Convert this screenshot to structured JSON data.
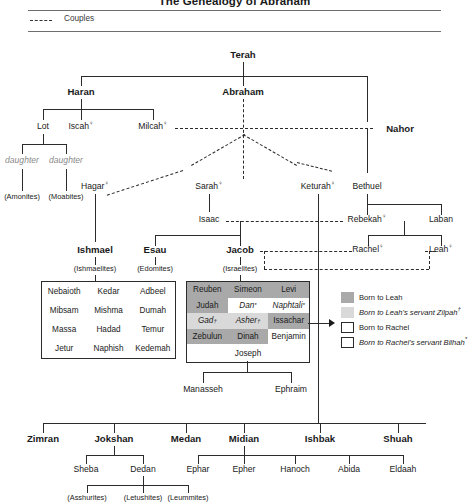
{
  "title": "The Genealogy of Abraham",
  "legend_couples": {
    "label": "Couples",
    "icon": "dashed-line-icon"
  },
  "people": {
    "terah": "Terah",
    "haran": "Haran",
    "abraham": "Abraham",
    "nahor": "Nahor",
    "lot": "Lot",
    "iscah": "Iscah",
    "milcah": "Milcah",
    "daughter1": "daughter",
    "daughter2": "daughter",
    "amonites": "(Amonites)",
    "moabites": "(Moabites)",
    "hagar": "Hagar",
    "sarah": "Sarah",
    "keturah": "Keturah",
    "bethuel": "Bethuel",
    "isaac": "Isaac",
    "rebekah": "Rebekah",
    "laban": "Laban",
    "ishmael": "Ishmael",
    "ishmaelites": "(Ishmaelites)",
    "esau": "Esau",
    "edomites": "(Edomites)",
    "jacob": "Jacob",
    "israelites": "(Israelites)",
    "rachel": "Rachel",
    "leah": "Leah",
    "joseph": "Joseph",
    "manasseh": "Manasseh",
    "ephraim": "Ephraim"
  },
  "female_mark": "♀",
  "ishmael_sons": [
    "Nebaioth",
    "Kedar",
    "Adbeel",
    "Mibsam",
    "Mishma",
    "Dumah",
    "Massa",
    "Hadad",
    "Temur",
    "Jetur",
    "Naphish",
    "Kedemah"
  ],
  "tribes": {
    "rows": [
      [
        {
          "name": "Reuben",
          "mother": "leah"
        },
        {
          "name": "Simeon",
          "mother": "leah"
        },
        {
          "name": "Levi",
          "mother": "leah"
        }
      ],
      [
        {
          "name": "Judah",
          "mother": "leah"
        },
        {
          "name": "Dan",
          "mother": "bilhah",
          "mark": "*"
        },
        {
          "name": "Naphtali",
          "mother": "bilhah",
          "mark": "*"
        }
      ],
      [
        {
          "name": "Gad",
          "mother": "zilpah",
          "mark": "†"
        },
        {
          "name": "Asher",
          "mother": "zilpah",
          "mark": "†"
        },
        {
          "name": "Issachar",
          "mother": "leah"
        }
      ],
      [
        {
          "name": "Zebulun",
          "mother": "leah"
        },
        {
          "name": "Dinah",
          "mother": "leah"
        },
        {
          "name": "Benjamin",
          "mother": "rachel"
        }
      ]
    ],
    "joseph": "Joseph"
  },
  "mother_legend": [
    {
      "swatch": "leah",
      "text": "Born to Leah",
      "italic": false,
      "mark": ""
    },
    {
      "swatch": "zilpah",
      "text": "Born to Leah's servant Zilpah",
      "italic": true,
      "mark": "†"
    },
    {
      "swatch": "rachel",
      "text": "Born to Rachel",
      "italic": false,
      "mark": ""
    },
    {
      "swatch": "bilhah",
      "text": "Born to Rachel's servant Bilhah",
      "italic": true,
      "mark": "*"
    }
  ],
  "keturah_sons": [
    "Zimran",
    "Jokshan",
    "Medan",
    "Midian",
    "Ishbak",
    "Shuah"
  ],
  "jokshan_sons": [
    "Sheba",
    "Dedan"
  ],
  "dedan_sons": [
    "(Asshurites)",
    "(Letushites)",
    "(Leummites)"
  ],
  "midian_sons": [
    "Ephar",
    "Epher",
    "Hanoch",
    "Abida",
    "Eldaah"
  ],
  "colors": {
    "leah": "#a9a9a9",
    "zilpah": "#d9d9d9",
    "rachel": "#ffffff",
    "bilhah": "#ffffff",
    "line": "#2b2b2b",
    "muted": "#8a8a8a"
  }
}
